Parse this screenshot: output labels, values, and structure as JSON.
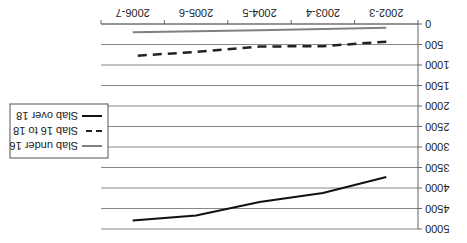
{
  "chart_data": {
    "type": "line",
    "title": "",
    "xlabel": "",
    "ylabel": "",
    "orientation_note": "image rendered rotated 180 degrees",
    "categories": [
      "2002-3",
      "2003-4",
      "2004-5",
      "2005-6",
      "2006-7"
    ],
    "ylim": [
      0,
      5000
    ],
    "yticks": [
      0,
      500,
      1000,
      1500,
      2000,
      2500,
      3000,
      3500,
      4000,
      4500,
      5000
    ],
    "grid": true,
    "legend_position": "right",
    "series": [
      {
        "name": "Slab under 16",
        "style": "solid",
        "color": "#808080",
        "values": [
          90,
          120,
          150,
          175,
          200
        ]
      },
      {
        "name": "Slab 16 to 18",
        "style": "dashed",
        "color": "#222222",
        "values": [
          430,
          540,
          550,
          680,
          780
        ]
      },
      {
        "name": "Slab over 18",
        "style": "solid",
        "color": "#111111",
        "values": [
          3730,
          4120,
          4340,
          4670,
          4790
        ]
      }
    ]
  }
}
